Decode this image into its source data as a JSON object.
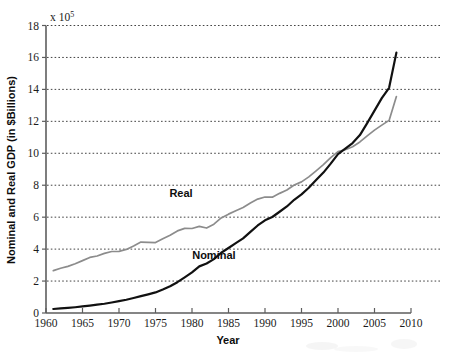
{
  "figure": {
    "background_color": "#ffffff",
    "exponent_prefix": "x 10",
    "exponent_power": "5"
  },
  "axes": {
    "x_title": "Year",
    "y_title": "Nominal and Real GDP (in $Billions)",
    "x_ticks": [
      "1960",
      "1965",
      "1970",
      "1975",
      "1980",
      "1985",
      "1990",
      "1995",
      "2000",
      "2005",
      "2010"
    ],
    "y_ticks": [
      "0",
      "2",
      "4",
      "6",
      "8",
      "10",
      "12",
      "14",
      "16",
      "18"
    ]
  },
  "annotations": {
    "real_label": "Real",
    "nominal_label": "Nominal"
  },
  "chart_data": {
    "type": "line",
    "title": "",
    "subtitle": "",
    "xlabel": "Year",
    "ylabel": "Nominal and Real GDP (in $Billions)",
    "y_scale_multiplier": "x 10^5",
    "xlim": [
      1960,
      2010
    ],
    "ylim": [
      0,
      18
    ],
    "x_tick_values": [
      1960,
      1965,
      1970,
      1975,
      1980,
      1985,
      1990,
      1995,
      2000,
      2005,
      2010
    ],
    "y_tick_values": [
      0,
      2,
      4,
      6,
      8,
      10,
      12,
      14,
      16,
      18
    ],
    "grid": "horizontal-dotted",
    "legend": "inline-annotations",
    "annotations": [
      {
        "text": "Real",
        "x": 1978.5,
        "y": 7.25
      },
      {
        "text": "Nominal",
        "x": 1983.0,
        "y": 3.35
      }
    ],
    "series": [
      {
        "name": "Real",
        "color": "#8c8c8c",
        "linewidth": 1.7,
        "x": [
          1961,
          1962,
          1963,
          1964,
          1965,
          1966,
          1967,
          1968,
          1969,
          1970,
          1971,
          1972,
          1973,
          1974,
          1975,
          1976,
          1977,
          1978,
          1979,
          1980,
          1981,
          1982,
          1983,
          1984,
          1985,
          1986,
          1987,
          1988,
          1989,
          1990,
          1991,
          1992,
          1993,
          1994,
          1995,
          1996,
          1997,
          1998,
          1999,
          2000,
          2001,
          2002,
          2003,
          2004,
          2005,
          2006,
          2007,
          2008
        ],
        "values": [
          2.65,
          2.8,
          2.92,
          3.08,
          3.28,
          3.48,
          3.57,
          3.73,
          3.85,
          3.86,
          3.98,
          4.2,
          4.44,
          4.42,
          4.41,
          4.65,
          4.87,
          5.14,
          5.3,
          5.29,
          5.42,
          5.32,
          5.56,
          5.95,
          6.19,
          6.4,
          6.61,
          6.89,
          7.13,
          7.26,
          7.25,
          7.49,
          7.7,
          8.01,
          8.21,
          8.52,
          8.9,
          9.29,
          9.73,
          10.1,
          10.22,
          10.41,
          10.71,
          11.09,
          11.45,
          11.76,
          12.06,
          13.55
        ]
      },
      {
        "name": "Nominal",
        "color": "#111111",
        "linewidth": 2.2,
        "x": [
          1961,
          1962,
          1963,
          1964,
          1965,
          1966,
          1967,
          1968,
          1969,
          1970,
          1971,
          1972,
          1973,
          1974,
          1975,
          1976,
          1977,
          1978,
          1979,
          1980,
          1981,
          1982,
          1983,
          1984,
          1985,
          1986,
          1987,
          1988,
          1989,
          1990,
          1991,
          1992,
          1993,
          1994,
          1995,
          1996,
          1997,
          1998,
          1999,
          2000,
          2001,
          2002,
          2003,
          2004,
          2005,
          2006,
          2007,
          2008
        ],
        "values": [
          0.25,
          0.29,
          0.32,
          0.36,
          0.41,
          0.46,
          0.52,
          0.58,
          0.66,
          0.74,
          0.83,
          0.94,
          1.06,
          1.17,
          1.29,
          1.47,
          1.67,
          1.93,
          2.23,
          2.54,
          2.92,
          3.1,
          3.37,
          3.77,
          4.07,
          4.37,
          4.67,
          5.08,
          5.48,
          5.8,
          6.01,
          6.34,
          6.67,
          7.09,
          7.43,
          7.84,
          8.32,
          8.79,
          9.35,
          9.95,
          10.29,
          10.64,
          11.14,
          11.89,
          12.67,
          13.45,
          14.1,
          16.3
        ]
      }
    ]
  }
}
